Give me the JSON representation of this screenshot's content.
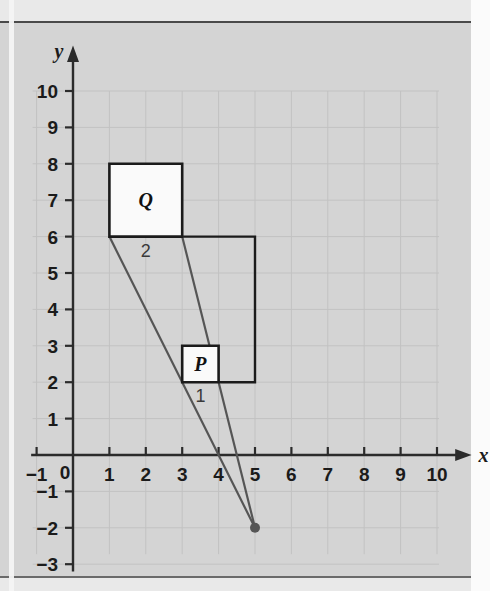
{
  "figure": {
    "kind": "coordinate-grid-enlargement-diagram",
    "background_color": "#d4d4d4",
    "grid_color": "#c2c2c2",
    "axis_color": "#2b2b2b",
    "shape_fill": "#fafafa",
    "shape_stroke": "#1b1b1b",
    "ray_color": "#555555",
    "center_dot_color": "#555555"
  },
  "axes": {
    "x": {
      "label": "x",
      "min": -1,
      "max": 10,
      "ticks": [
        "-1",
        "1",
        "2",
        "3",
        "4",
        "5",
        "6",
        "7",
        "8",
        "9",
        "10"
      ],
      "tick_values": [
        -1,
        1,
        2,
        3,
        4,
        5,
        6,
        7,
        8,
        9,
        10
      ],
      "arrow": true
    },
    "y": {
      "label": "y",
      "min": -3,
      "max": 10,
      "ticks": [
        "10",
        "9",
        "8",
        "7",
        "6",
        "5",
        "4",
        "3",
        "2",
        "1",
        "-1",
        "-2",
        "-3"
      ],
      "tick_values": [
        10,
        9,
        8,
        7,
        6,
        5,
        4,
        3,
        2,
        1,
        -1,
        -2,
        -3
      ],
      "arrow": true
    },
    "origin_label": "0"
  },
  "shapes": [
    {
      "id": "square-Q",
      "label": "Q",
      "side_label": "2",
      "points": [
        [
          1,
          6
        ],
        [
          3,
          6
        ],
        [
          3,
          8
        ],
        [
          1,
          8
        ]
      ],
      "label_point": [
        2,
        7
      ],
      "side_label_point": [
        2,
        6
      ]
    },
    {
      "id": "square-P",
      "label": "P",
      "side_label": "1",
      "points": [
        [
          3,
          2
        ],
        [
          4,
          2
        ],
        [
          4,
          3
        ],
        [
          3,
          3
        ]
      ],
      "label_point": [
        3.5,
        2.5
      ],
      "side_label_point": [
        3.5,
        2
      ]
    }
  ],
  "construction": {
    "outline_id": "projection-outline",
    "outline_points": [
      [
        3,
        6
      ],
      [
        5,
        6
      ],
      [
        5,
        2
      ],
      [
        4,
        2
      ]
    ],
    "rays": [
      {
        "id": "ray-from-1-6",
        "from": [
          1,
          6
        ],
        "to": [
          5,
          -2
        ]
      },
      {
        "id": "ray-from-3-6",
        "from": [
          3,
          6
        ],
        "to": [
          5,
          -2
        ]
      }
    ],
    "center_of_enlargement": [
      5,
      -2
    ]
  },
  "chart_data": {
    "type": "scatter",
    "title": "",
    "xlabel": "x",
    "ylabel": "y",
    "xlim": [
      -1,
      10
    ],
    "ylim": [
      -3,
      10
    ],
    "grid": true,
    "legend": "none",
    "unit_px": 36.4,
    "origin_px": [
      73,
      455
    ],
    "annotations": [
      {
        "text": "Q",
        "x": 2,
        "y": 7
      },
      {
        "text": "2",
        "x": 2,
        "y": 6
      },
      {
        "text": "P",
        "x": 3.5,
        "y": 2.5
      },
      {
        "text": "1",
        "x": 3.5,
        "y": 2
      }
    ],
    "series": [
      {
        "name": "square Q",
        "type": "polygon",
        "x": [
          1,
          3,
          3,
          1,
          1
        ],
        "y": [
          6,
          6,
          8,
          8,
          6
        ]
      },
      {
        "name": "square P",
        "type": "polygon",
        "x": [
          3,
          4,
          4,
          3,
          3
        ],
        "y": [
          2,
          2,
          3,
          3,
          2
        ]
      },
      {
        "name": "projection outline",
        "type": "polyline",
        "x": [
          3,
          5,
          5,
          4
        ],
        "y": [
          6,
          6,
          2,
          2
        ]
      },
      {
        "name": "ray A",
        "type": "line",
        "x": [
          1,
          5
        ],
        "y": [
          6,
          -2
        ]
      },
      {
        "name": "ray B",
        "type": "line",
        "x": [
          3,
          5
        ],
        "y": [
          6,
          -2
        ]
      },
      {
        "name": "centre of enlargement",
        "type": "point",
        "x": [
          5
        ],
        "y": [
          -2
        ]
      }
    ]
  }
}
